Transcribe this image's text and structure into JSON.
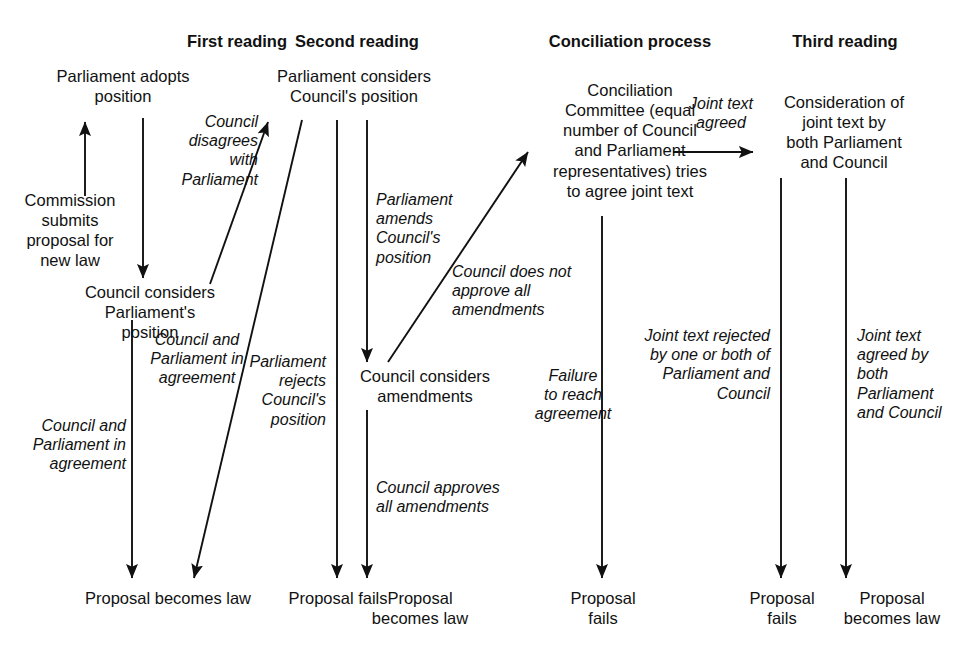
{
  "diagram": {
    "line_color": "#111111",
    "background_color": "#ffffff"
  },
  "stage_titles": [
    {
      "id": "first-reading",
      "label": "First reading",
      "x": 132,
      "y": 32,
      "w": 210
    },
    {
      "id": "second-reading",
      "label": "Second reading",
      "x": 252,
      "y": 32,
      "w": 210
    },
    {
      "id": "conciliation-process",
      "label": "Conciliation process",
      "x": 510,
      "y": 32,
      "w": 240
    },
    {
      "id": "third-reading",
      "label": "Third reading",
      "x": 740,
      "y": 32,
      "w": 210
    }
  ],
  "nodes": [
    {
      "id": "parliament-adopts-position",
      "label": "Parliament adopts\nposition",
      "x": 18,
      "y": 66,
      "w": 210,
      "align": "center"
    },
    {
      "id": "commission-submits-proposal",
      "label": "Commission\nsubmits\nproposal for\nnew law",
      "x": 6,
      "y": 190,
      "w": 128,
      "align": "center"
    },
    {
      "id": "council-considers-parliament-position",
      "label": "Council considers\nParliament's\nposition",
      "x": 55,
      "y": 282,
      "w": 190,
      "align": "center"
    },
    {
      "id": "parliament-considers-council-position",
      "label": "Parliament considers\nCouncil's position",
      "x": 240,
      "y": 66,
      "w": 228,
      "align": "center"
    },
    {
      "id": "council-considers-amendments",
      "label": "Council considers\namendments",
      "x": 330,
      "y": 366,
      "w": 190,
      "align": "center"
    },
    {
      "id": "conciliation-committee",
      "label": "Conciliation\nCommittee (equal\nnumber of Council\nand Parliament\nrepresentatives) tries\nto agree joint text",
      "x": 522,
      "y": 80,
      "w": 216,
      "align": "center"
    },
    {
      "id": "consideration-of-joint-text",
      "label": "Consideration of\njoint text by\nboth Parliament\nand Council",
      "x": 753,
      "y": 92,
      "w": 182,
      "align": "center"
    }
  ],
  "edge_labels": [
    {
      "id": "council-disagrees-with-parliament",
      "label": "Council\ndisagrees\nwith\nParliament",
      "x": 150,
      "y": 112,
      "w": 108,
      "align": "right"
    },
    {
      "id": "council-and-parliament-in-agreement-left",
      "label": "Council and\nParliament in\nagreement",
      "x": 4,
      "y": 416,
      "w": 122,
      "align": "right"
    },
    {
      "id": "council-and-parliament-in-agreement-mid",
      "label": "Council and\nParliament in\nagreement",
      "x": 138,
      "y": 330,
      "w": 118,
      "align": "center"
    },
    {
      "id": "parliament-rejects-councils-position",
      "label": "Parliament\nrejects\nCouncil's\nposition",
      "x": 214,
      "y": 352,
      "w": 112,
      "align": "right"
    },
    {
      "id": "parliament-amends-councils-position",
      "label": "Parliament\namends\nCouncil's\nposition",
      "x": 376,
      "y": 190,
      "w": 110,
      "align": "left"
    },
    {
      "id": "council-does-not-approve-all-amendments",
      "label": "Council does not\napprove all\namendments",
      "x": 452,
      "y": 262,
      "w": 160,
      "align": "left"
    },
    {
      "id": "council-approves-all-amendments",
      "label": "Council approves\nall amendments",
      "x": 376,
      "y": 478,
      "w": 170,
      "align": "left"
    },
    {
      "id": "failure-to-reach-agreement",
      "label": "Failure\nto reach\nagreement",
      "x": 528,
      "y": 366,
      "w": 90,
      "align": "center"
    },
    {
      "id": "joint-text-agreed-top",
      "label": "Joint text\nagreed",
      "x": 676,
      "y": 94,
      "w": 90,
      "align": "center"
    },
    {
      "id": "joint-text-rejected-by-one-or-both",
      "label": "Joint text rejected\nby one or both of\nParliament and\nCouncil",
      "x": 618,
      "y": 326,
      "w": 152,
      "align": "right"
    },
    {
      "id": "joint-text-agreed-by-both",
      "label": "Joint text\nagreed by\nboth\nParliament\nand Council",
      "x": 857,
      "y": 326,
      "w": 120,
      "align": "left"
    }
  ],
  "outcomes": [
    {
      "id": "outcome-proposal-becomes-law-1",
      "label": "Proposal becomes law",
      "x": 48,
      "y": 588,
      "w": 240,
      "align": "center"
    },
    {
      "id": "outcome-proposal-fails-1",
      "label": "Proposal fails",
      "x": 252,
      "y": 588,
      "w": 172,
      "align": "center"
    },
    {
      "id": "outcome-proposal-becomes-law-2",
      "label": "Proposal\nbecomes law",
      "x": 358,
      "y": 588,
      "w": 124,
      "align": "center"
    },
    {
      "id": "outcome-proposal-fails-2",
      "label": "Proposal\nfails",
      "x": 555,
      "y": 588,
      "w": 96,
      "align": "center"
    },
    {
      "id": "outcome-proposal-fails-3",
      "label": "Proposal\nfails",
      "x": 735,
      "y": 588,
      "w": 94,
      "align": "center"
    },
    {
      "id": "outcome-proposal-becomes-law-3",
      "label": "Proposal\nbecomes law",
      "x": 828,
      "y": 588,
      "w": 128,
      "align": "center"
    }
  ],
  "connectors": [
    {
      "id": "commission-to-parliament-arrow",
      "kind": "arrow",
      "x1": 85,
      "y1": 196,
      "x2": 85,
      "y2": 122
    },
    {
      "id": "parliament-to-council-arrow",
      "kind": "arrow",
      "x1": 143,
      "y1": 118,
      "x2": 143,
      "y2": 278
    },
    {
      "id": "council-disagrees-diagonal-arrow",
      "kind": "arrow",
      "x1": 210,
      "y1": 284,
      "x2": 268,
      "y2": 122
    },
    {
      "id": "parliament-rejects-diagonal-arrow",
      "kind": "arrow",
      "x1": 302,
      "y1": 120,
      "x2": 194,
      "y2": 578
    },
    {
      "id": "council-parliament-agreement-left-line",
      "kind": "arrow",
      "x1": 132,
      "y1": 320,
      "x2": 132,
      "y2": 578
    },
    {
      "id": "second-reading-left-vertical-arrow",
      "kind": "arrow",
      "x1": 337,
      "y1": 120,
      "x2": 337,
      "y2": 578
    },
    {
      "id": "parliament-amends-vertical-arrow",
      "kind": "arrow",
      "x1": 367,
      "y1": 120,
      "x2": 367,
      "y2": 362
    },
    {
      "id": "council-approves-vertical-arrow",
      "kind": "arrow",
      "x1": 367,
      "y1": 410,
      "x2": 367,
      "y2": 578
    },
    {
      "id": "council-does-not-approve-diagonal-arrow",
      "kind": "arrow",
      "x1": 388,
      "y1": 362,
      "x2": 528,
      "y2": 152
    },
    {
      "id": "conciliation-failure-vertical-arrow",
      "kind": "arrow",
      "x1": 602,
      "y1": 216,
      "x2": 602,
      "y2": 578
    },
    {
      "id": "joint-text-agreed-horizontal-arrow",
      "kind": "arrow",
      "x1": 673,
      "y1": 152,
      "x2": 753,
      "y2": 152
    },
    {
      "id": "joint-text-rejected-vertical-arrow",
      "kind": "arrow",
      "x1": 781,
      "y1": 178,
      "x2": 781,
      "y2": 578
    },
    {
      "id": "joint-text-agreed-vertical-arrow",
      "kind": "arrow",
      "x1": 846,
      "y1": 178,
      "x2": 846,
      "y2": 578
    }
  ]
}
